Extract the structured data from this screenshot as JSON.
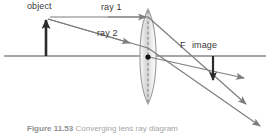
{
  "figure": {
    "caption_number": "Figure 11.53",
    "caption_text": "Converging lens ray diagram",
    "width": 270,
    "height": 135,
    "background": "#ffffff"
  },
  "labels": {
    "object": "object",
    "ray1": "ray 1",
    "ray2": "ray 2",
    "focal_point": "F",
    "image": "image"
  },
  "colors": {
    "axis": "#8a8a8a",
    "ray": "#7d7d7d",
    "arrow_object": "#2b2b2b",
    "arrow_image": "#2b2b2b",
    "lens_outline": "#9a9a9a",
    "lens_fill_light": "#f4f4f4",
    "lens_fill_mid": "#d8d8d8",
    "center_dot": "#111111",
    "dashed_axis": "#6f6f6f",
    "label_text": "#3a3a3a",
    "caption_text": "#a5a5a5"
  },
  "geometry": {
    "optical_axis_y": 56,
    "axis_x_start": 4,
    "axis_x_end": 266,
    "lens_center_x": 148,
    "lens_top_y": 9,
    "lens_bottom_y": 104,
    "lens_half_width": 11,
    "object_base_x": 46,
    "object_tip_y": 17,
    "image_base_x": 213,
    "image_tip_y": 84,
    "focal_point_x": 185,
    "ray1_start_x": 50,
    "ray1_y": 17,
    "ray2_exit_x": 262,
    "ray2_exit_y": 128,
    "ray1_exit_x": 248,
    "ray1_exit_y": 106
  }
}
